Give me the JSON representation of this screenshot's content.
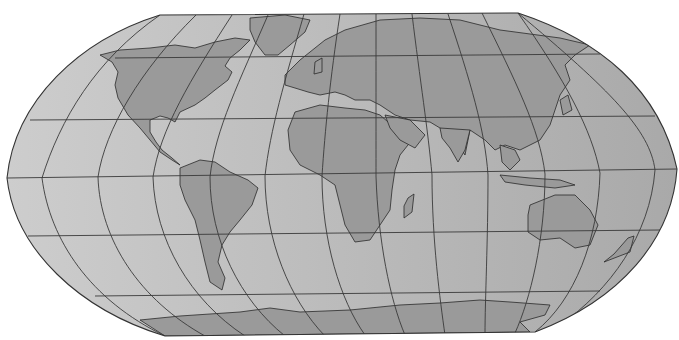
{
  "map": {
    "title": "",
    "projection": "robinson",
    "width": 679,
    "height": 340,
    "colors": {
      "background": "#ffffff",
      "ocean_left": "#cdcdcd",
      "ocean_right": "#a9a9a9",
      "land": "#9a9a9a",
      "coastline": "#2a2a2a",
      "graticule": "#3a3a3a"
    },
    "graticule": {
      "meridian_step_deg": 30,
      "parallel_step_deg": 30,
      "parallels_y": {
        "60N": 58,
        "30N": 118,
        "0": 175,
        "30S": 233,
        "60S": 292
      }
    },
    "outline": "M160,15 L518,13 C600,40 660,90 677,169 C672,240 620,300 535,332 L165,336 C80,310 15,250 7,178 C15,100 80,40 160,15 Z",
    "meridians": [
      "M160,15 C95,60 60,120 42,178 C50,240 90,300 165,336",
      "M196,15 C140,70 105,130 98,177 C100,240 140,300 205,336",
      "M232,15 C190,80 160,130 153,177 C155,240 190,300 245,336",
      "M268,15 C240,80 215,130 210,177 C210,240 240,300 285,336",
      "M304,14 C285,80 270,130 265,176 C265,240 290,300 325,336",
      "M340,14 C330,80 325,130 322,176 C322,240 340,300 365,335",
      "M376,14 C376,80 376,130 376,176 C378,240 390,300 405,335",
      "M412,14 C420,80 428,130 432,175 C432,240 440,300 445,335",
      "M448,14 C470,80 485,130 488,175 C488,240 485,300 485,334",
      "M482,13 C515,80 540,130 545,174 C545,240 530,300 515,333",
      "M518,13 C565,80 592,130 600,173 C598,240 575,300 535,332",
      "M518,13 C610,90 650,130 655,170 C650,235 610,290 560,325"
    ],
    "parallels": [
      "M115,58 L600,54",
      "M30,120 L655,116",
      "M7,178 L677,169",
      "M28,236 L660,230",
      "M95,296 L600,291"
    ],
    "landmasses": [
      {
        "name": "north-america",
        "d": "M100,55 L120,50 L150,48 L175,45 L195,48 L215,42 L235,38 L250,40 L240,50 L230,58 L225,66 L232,72 L228,80 L215,90 L205,98 L195,105 L180,112 L175,122 L168,118 L160,116 L150,120 L150,132 L156,142 L162,150 L172,158 L180,165 L172,160 L160,152 L150,140 L140,128 L128,115 L118,98 L115,85 L118,72 L112,62 Z"
      },
      {
        "name": "greenland",
        "d": "M250,18 L285,15 L310,20 L305,32 L290,45 L278,55 L265,55 L255,42 L250,30 Z"
      },
      {
        "name": "south-america",
        "d": "M180,168 L200,160 L215,162 L230,172 L248,180 L258,188 L252,205 L240,220 L230,232 L222,245 L218,262 L225,278 L222,290 L210,282 L205,262 L200,240 L195,220 L185,200 L180,185 Z"
      },
      {
        "name": "europe-asia",
        "d": "M285,75 L300,60 L310,52 L325,40 L345,30 L380,20 L420,18 L460,20 L500,30 L560,38 L590,45 L575,55 L565,65 L570,80 L560,95 L555,110 L550,125 L540,140 L520,150 L505,145 L495,150 L485,140 L470,130 L465,155 L455,140 L440,128 L430,122 L410,120 L395,115 L380,105 L370,100 L355,100 L345,95 L335,92 L320,95 L308,92 L295,88 L285,85 Z"
      },
      {
        "name": "africa",
        "d": "M295,112 L320,105 L345,108 L365,110 L380,115 L395,128 L412,140 L400,155 L395,170 L392,190 L390,210 L380,225 L370,240 L355,242 L345,225 L340,205 L335,185 L320,175 L300,165 L290,150 L288,130 Z"
      },
      {
        "name": "madagascar",
        "d": "M408,198 L414,194 L412,212 L404,218 L404,206 Z"
      },
      {
        "name": "arabia",
        "d": "M385,115 L410,120 L425,135 L415,148 L400,140 L390,128 Z"
      },
      {
        "name": "india",
        "d": "M440,128 L470,130 L465,150 L458,162 L450,148 L442,138 Z"
      },
      {
        "name": "southeast-asia",
        "d": "M500,145 L515,150 L520,160 L510,170 L502,162 Z"
      },
      {
        "name": "indonesia",
        "d": "M500,175 L530,178 L560,180 L575,185 L555,188 L525,185 L505,182 Z"
      },
      {
        "name": "australia",
        "d": "M530,205 L555,195 L575,195 L590,210 L598,225 L590,245 L575,248 L560,238 L540,240 L528,232 L528,215 Z"
      },
      {
        "name": "new-zealand",
        "d": "M628,238 L634,236 L630,252 L604,262 L614,254 Z"
      },
      {
        "name": "japan",
        "d": "M560,100 L568,95 L572,110 L563,115 Z"
      },
      {
        "name": "uk",
        "d": "M315,62 L322,58 L322,72 L314,74 Z"
      },
      {
        "name": "antarctica",
        "d": "M140,320 L180,316 L240,312 L270,308 L300,312 L350,310 L400,305 L440,303 L480,300 L510,302 L550,305 L545,315 L520,322 L530,332 L165,336 Z"
      }
    ]
  }
}
